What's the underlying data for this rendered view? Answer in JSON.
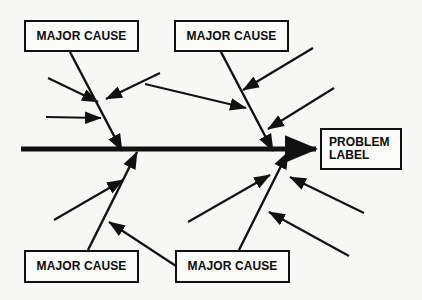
{
  "diagram": {
    "type": "fishbone-ishikawa-diagram",
    "background_color": "#f7f7f5",
    "stroke_color": "#111111",
    "box_fill_color": "#fbfbf9",
    "spine": {
      "name": "main-spine-arrow",
      "label": "",
      "x1": 21,
      "y1": 149,
      "x2": 316,
      "y2": 149,
      "stroke_width": 5,
      "arrowhead": "right"
    },
    "nodes": [
      {
        "id": "major-cause-top-left",
        "label": "MAJOR CAUSE",
        "x": 24,
        "y": 20,
        "w": 115,
        "h": 32,
        "align": "center"
      },
      {
        "id": "major-cause-top-right",
        "label": "MAJOR CAUSE",
        "x": 174,
        "y": 20,
        "w": 115,
        "h": 32,
        "align": "center"
      },
      {
        "id": "major-cause-bottom-left",
        "label": "MAJOR CAUSE",
        "x": 24,
        "y": 250,
        "w": 115,
        "h": 33,
        "align": "center"
      },
      {
        "id": "major-cause-bottom-right",
        "label": "MAJOR CAUSE",
        "x": 175,
        "y": 250,
        "w": 115,
        "h": 33,
        "align": "center"
      },
      {
        "id": "problem-label",
        "label": "PROBLEM\nLABEL",
        "x": 320,
        "y": 128,
        "w": 82,
        "h": 42,
        "align": "left"
      }
    ],
    "branches": [
      {
        "id": "branch-top-left",
        "name": "major-cause-branch-top-left",
        "x1": 70,
        "y1": 52,
        "x2": 122,
        "y2": 151,
        "stroke_width": 2.4,
        "arrowhead": "end"
      },
      {
        "id": "branch-top-right",
        "name": "major-cause-branch-top-right",
        "x1": 221,
        "y1": 52,
        "x2": 273,
        "y2": 151,
        "stroke_width": 2.4,
        "arrowhead": "end"
      },
      {
        "id": "branch-bottom-left",
        "name": "major-cause-branch-bottom-left",
        "x1": 88,
        "y1": 250,
        "x2": 137,
        "y2": 152,
        "stroke_width": 2.4,
        "arrowhead": "end"
      },
      {
        "id": "branch-bottom-right",
        "name": "major-cause-branch-bottom-right",
        "x1": 239,
        "y1": 250,
        "x2": 288,
        "y2": 152,
        "stroke_width": 2.4,
        "arrowhead": "end"
      }
    ],
    "sub_causes": [
      {
        "id": "sub-cause-tl-1",
        "name": "sub-cause-arrow-top-left-upper",
        "x1": 48,
        "y1": 78,
        "x2": 98,
        "y2": 102,
        "stroke_width": 2.1
      },
      {
        "id": "sub-cause-tl-2",
        "name": "sub-cause-arrow-top-left-lower",
        "x1": 46,
        "y1": 117,
        "x2": 101,
        "y2": 118,
        "stroke_width": 2.1
      },
      {
        "id": "sub-cause-tl-3",
        "name": "sub-cause-arrow-top-left-right",
        "x1": 160,
        "y1": 73,
        "x2": 106,
        "y2": 99,
        "stroke_width": 2.1
      },
      {
        "id": "sub-cause-tr-1",
        "name": "sub-cause-arrow-top-right-left",
        "x1": 145,
        "y1": 84,
        "x2": 246,
        "y2": 108,
        "stroke_width": 2.1
      },
      {
        "id": "sub-cause-tr-2",
        "name": "sub-cause-arrow-top-right-upper",
        "x1": 313,
        "y1": 48,
        "x2": 243,
        "y2": 90,
        "stroke_width": 2.1
      },
      {
        "id": "sub-cause-tr-3",
        "name": "sub-cause-arrow-top-right-lower",
        "x1": 334,
        "y1": 88,
        "x2": 268,
        "y2": 129,
        "stroke_width": 2.1
      },
      {
        "id": "sub-cause-bl-1",
        "name": "sub-cause-arrow-bottom-left-lower",
        "x1": 54,
        "y1": 220,
        "x2": 123,
        "y2": 180,
        "stroke_width": 2.1
      },
      {
        "id": "sub-cause-bl-2",
        "name": "sub-cause-arrow-bottom-left-right",
        "x1": 176,
        "y1": 266,
        "x2": 109,
        "y2": 222,
        "stroke_width": 2.1
      },
      {
        "id": "sub-cause-br-1",
        "name": "sub-cause-arrow-bottom-right-left",
        "x1": 188,
        "y1": 222,
        "x2": 270,
        "y2": 175,
        "stroke_width": 2.1
      },
      {
        "id": "sub-cause-br-2",
        "name": "sub-cause-arrow-bottom-right-upper",
        "x1": 364,
        "y1": 213,
        "x2": 290,
        "y2": 177,
        "stroke_width": 2.1
      },
      {
        "id": "sub-cause-br-3",
        "name": "sub-cause-arrow-bottom-right-lower",
        "x1": 349,
        "y1": 256,
        "x2": 269,
        "y2": 212,
        "stroke_width": 2.1
      }
    ]
  }
}
